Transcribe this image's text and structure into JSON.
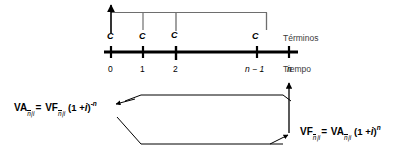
{
  "diagram": {
    "type": "annuity-timeline-diagram",
    "language": "es",
    "background_color": "#ffffff",
    "line_color": "#000000",
    "stem_color": "#555555",
    "row_labels": {
      "terms": "Términos",
      "time": "Tiempo"
    },
    "payments": {
      "symbol": "C",
      "count": 4,
      "labels": [
        "C",
        "C",
        "C",
        "C"
      ],
      "at_periods": [
        "0",
        "1",
        "2",
        "n-1"
      ]
    },
    "time_axis": {
      "tick_labels": [
        "0",
        "1",
        "2",
        "n 1",
        "n"
      ],
      "tick_label_display": [
        "0",
        "1",
        "2",
        "n − 1",
        "n"
      ],
      "italic_ticks": [
        3,
        4
      ]
    },
    "formulas": {
      "present_value": {
        "lhs_var": "VA",
        "lhs_sub": "n|i",
        "equals": "=",
        "rhs_var": "VF",
        "rhs_sub": "n|i",
        "factor_open": "(1 +",
        "factor_rate": "i",
        "factor_close": ")",
        "exponent": "-n",
        "plain": "VA n|i = VF n|i (1 + i)^-n"
      },
      "future_value": {
        "lhs_var": "VF",
        "lhs_sub": "n|i",
        "equals": "=",
        "rhs_var": "VA",
        "rhs_sub": "n|i",
        "factor_open": "(1 +",
        "factor_rate": "i",
        "factor_close": ")",
        "exponent": "n",
        "plain": "VF n|i = VA n|i (1 + i)^n"
      }
    },
    "arrows": {
      "discount_direction": "right-to-left",
      "capitalize_direction": "left-to-right",
      "vertical_marker_at": "n"
    }
  }
}
